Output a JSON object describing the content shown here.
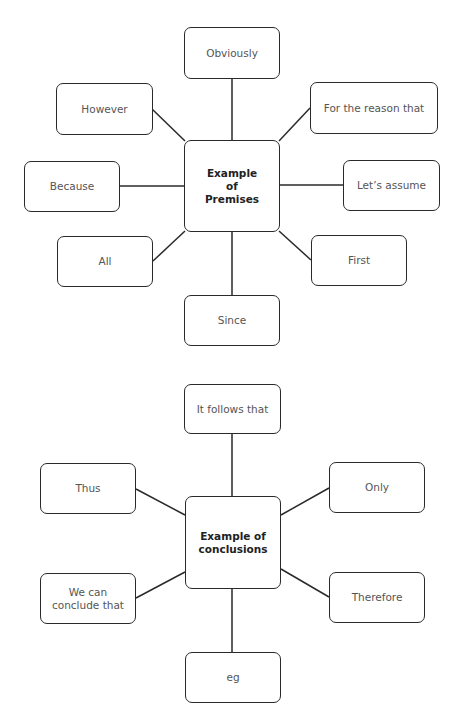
{
  "premises": {
    "center": "Example of Premises",
    "nodes": {
      "top": "Obviously",
      "top_left": "However",
      "top_right": "For the reason that",
      "left": "Because",
      "right": "Let’s assume",
      "bottom_left": "All",
      "bottom_right": "First",
      "bottom": "Since"
    }
  },
  "conclusions": {
    "center": "Example of conclusions",
    "nodes": {
      "top": "It follows that",
      "top_left": "Thus",
      "top_right": "Only",
      "bottom_left": "We can conclude that",
      "bottom_right": "Therefore",
      "bottom": "eg"
    }
  }
}
